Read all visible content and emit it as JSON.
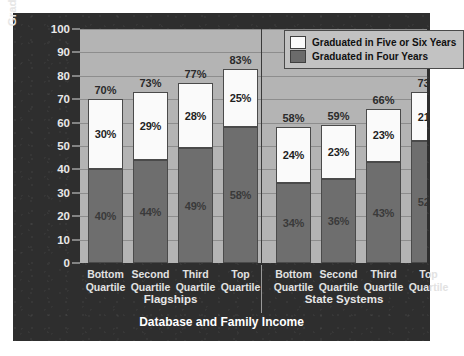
{
  "chart_data": {
    "type": "bar",
    "subtype": "stacked-bar",
    "title": "",
    "xlabel": "Database and Family Income",
    "ylabel": "Graduation Rate (Percent)",
    "ylim": [
      0,
      100
    ],
    "ytick_step": 10,
    "yticks": [
      "100",
      "90",
      "80",
      "70",
      "60",
      "50",
      "40",
      "30",
      "20",
      "10",
      "0"
    ],
    "grid": true,
    "legend_position": "top-right",
    "legend": [
      "Graduated in Five or Six Years",
      "Graduated in Four Years"
    ],
    "groups": [
      {
        "name": "Flagships",
        "categories": [
          "Bottom Quartile",
          "Second Quartile",
          "Third Quartile",
          "Top Quartile"
        ]
      },
      {
        "name": "State Systems",
        "categories": [
          "Bottom Quartile",
          "Second Quartile",
          "Third Quartile",
          "Top Quartile"
        ]
      }
    ],
    "categories": [
      "Bottom Quartile",
      "Second Quartile",
      "Third Quartile",
      "Top Quartile",
      "Bottom Quartile",
      "Second Quartile",
      "Third Quartile",
      "Top Quartile"
    ],
    "series": [
      {
        "name": "Graduated in Four Years",
        "color": "#6e6e6e",
        "values": [
          40,
          44,
          49,
          58,
          34,
          36,
          43,
          52
        ]
      },
      {
        "name": "Graduated in Five or Six Years",
        "color": "#fafafa",
        "values": [
          30,
          29,
          28,
          25,
          24,
          23,
          23,
          21
        ]
      }
    ],
    "totals": [
      70,
      73,
      77,
      83,
      58,
      59,
      66,
      73
    ],
    "bars": [
      {
        "group": "Flagships",
        "category": "Bottom Quartile",
        "four": 40,
        "fivesix": 30,
        "total": 70,
        "four_label": "40%",
        "fivesix_label": "30%",
        "total_label": "70%"
      },
      {
        "group": "Flagships",
        "category": "Second Quartile",
        "four": 44,
        "fivesix": 29,
        "total": 73,
        "four_label": "44%",
        "fivesix_label": "29%",
        "total_label": "73%"
      },
      {
        "group": "Flagships",
        "category": "Third Quartile",
        "four": 49,
        "fivesix": 28,
        "total": 77,
        "four_label": "49%",
        "fivesix_label": "28%",
        "total_label": "77%"
      },
      {
        "group": "Flagships",
        "category": "Top Quartile",
        "four": 58,
        "fivesix": 25,
        "total": 83,
        "four_label": "58%",
        "fivesix_label": "25%",
        "total_label": "83%"
      },
      {
        "group": "State Systems",
        "category": "Bottom Quartile",
        "four": 34,
        "fivesix": 24,
        "total": 58,
        "four_label": "34%",
        "fivesix_label": "24%",
        "total_label": "58%"
      },
      {
        "group": "State Systems",
        "category": "Second Quartile",
        "four": 36,
        "fivesix": 23,
        "total": 59,
        "four_label": "36%",
        "fivesix_label": "23%",
        "total_label": "59%"
      },
      {
        "group": "State Systems",
        "category": "Third Quartile",
        "four": 43,
        "fivesix": 23,
        "total": 66,
        "four_label": "43%",
        "fivesix_label": "23%",
        "total_label": "66%"
      },
      {
        "group": "State Systems",
        "category": "Top Quartile",
        "four": 52,
        "fivesix": 21,
        "total": 73,
        "four_label": "52%",
        "fivesix_label": "21%",
        "total_label": "73%"
      }
    ],
    "xtick_lines": [
      {
        "line1": "Bottom",
        "line2": "Quartile"
      },
      {
        "line1": "Second",
        "line2": "Quartile"
      },
      {
        "line1": "Third",
        "line2": "Quartile"
      },
      {
        "line1": "Top",
        "line2": "Quartile"
      },
      {
        "line1": "Bottom",
        "line2": "Quartile"
      },
      {
        "line1": "Second",
        "line2": "Quartile"
      },
      {
        "line1": "Third",
        "line2": "Quartile"
      },
      {
        "line1": "Top",
        "line2": "Quartile"
      }
    ],
    "group_labels": [
      "Flagships",
      "State Systems"
    ],
    "colors": {
      "chart_background": "#2e2e2e",
      "plot_background": "#b4b4b4",
      "four_years": "#6e6e6e",
      "five_or_six_years": "#fafafa",
      "gridline": "#8d8d8d",
      "axis_text": "#e6e6e6"
    }
  }
}
